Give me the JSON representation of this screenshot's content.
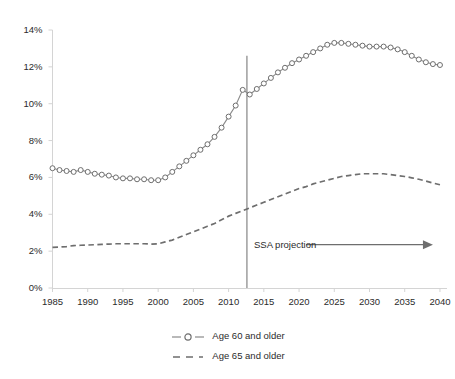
{
  "chart_data": {
    "type": "line",
    "title": "",
    "subtitle": "",
    "xlabel": "",
    "ylabel": "",
    "xlim": [
      1985,
      2041
    ],
    "ylim": [
      0,
      14
    ],
    "grid": false,
    "legend_position": "bottom",
    "y_tick_labels": [
      "0%",
      "2%",
      "4%",
      "6%",
      "8%",
      "10%",
      "12%",
      "14%"
    ],
    "y_ticks": [
      0,
      2,
      4,
      6,
      8,
      10,
      12,
      14
    ],
    "x_tick_labels": [
      "1985",
      "1990",
      "1995",
      "2000",
      "2005",
      "2010",
      "2015",
      "2020",
      "2025",
      "2030",
      "2035",
      "2040"
    ],
    "x_ticks": [
      1985,
      1990,
      1995,
      2000,
      2005,
      2010,
      2015,
      2020,
      2025,
      2030,
      2035,
      2040
    ],
    "x": [
      1985,
      1986,
      1987,
      1988,
      1989,
      1990,
      1991,
      1992,
      1993,
      1994,
      1995,
      1996,
      1997,
      1998,
      1999,
      2000,
      2001,
      2002,
      2003,
      2004,
      2005,
      2006,
      2007,
      2008,
      2009,
      2010,
      2011,
      2012,
      2013,
      2014,
      2015,
      2016,
      2017,
      2018,
      2019,
      2020,
      2021,
      2022,
      2023,
      2024,
      2025,
      2026,
      2027,
      2028,
      2029,
      2030,
      2031,
      2032,
      2033,
      2034,
      2035,
      2036,
      2037,
      2038,
      2039,
      2040
    ],
    "series": [
      {
        "name": "Age 60 and older",
        "style": "line-with-open-circle-markers",
        "color": "#7a7a7a",
        "values": [
          6.5,
          6.4,
          6.35,
          6.3,
          6.4,
          6.3,
          6.2,
          6.15,
          6.1,
          6.0,
          5.95,
          5.95,
          5.9,
          5.9,
          5.85,
          5.85,
          6.0,
          6.3,
          6.6,
          6.9,
          7.2,
          7.5,
          7.8,
          8.2,
          8.7,
          9.3,
          9.9,
          10.75,
          10.5,
          10.8,
          11.1,
          11.4,
          11.7,
          11.95,
          12.2,
          12.4,
          12.6,
          12.8,
          13.0,
          13.2,
          13.3,
          13.3,
          13.25,
          13.2,
          13.15,
          13.1,
          13.1,
          13.1,
          13.05,
          12.95,
          12.8,
          12.6,
          12.4,
          12.25,
          12.15,
          12.1
        ]
      },
      {
        "name": "Age 65 and older",
        "style": "dashed-line",
        "color": "#6e6e6e",
        "values": [
          2.2,
          2.22,
          2.25,
          2.3,
          2.32,
          2.33,
          2.35,
          2.37,
          2.38,
          2.4,
          2.4,
          2.4,
          2.4,
          2.4,
          2.38,
          2.4,
          2.5,
          2.6,
          2.75,
          2.9,
          3.05,
          3.2,
          3.35,
          3.5,
          3.7,
          3.9,
          4.05,
          4.2,
          4.35,
          4.5,
          4.65,
          4.8,
          4.95,
          5.1,
          5.25,
          5.4,
          5.5,
          5.65,
          5.75,
          5.85,
          5.95,
          6.05,
          6.1,
          6.15,
          6.2,
          6.2,
          6.2,
          6.2,
          6.15,
          6.1,
          6.05,
          5.98,
          5.9,
          5.8,
          5.7,
          5.6
        ]
      }
    ],
    "annotations": [
      {
        "name": "ssa-projection",
        "text": "SSA projection",
        "type": "text-with-arrow",
        "arrow_direction": "right",
        "arrow_from_year": 2021,
        "arrow_to_year": 2039,
        "at_value": 2.35
      },
      {
        "name": "projection-divider",
        "type": "vertical-line",
        "at_year": 2012.6,
        "color": "#7a7a7a"
      }
    ],
    "colors": {
      "axis": "#d4d4d4",
      "series_60": "#7a7a7a",
      "series_65": "#6e6e6e",
      "text": "#2b2b2b",
      "background": "#ffffff",
      "divider": "#7a7a7a",
      "arrow": "#6e6e6e"
    }
  },
  "legend": {
    "items": [
      {
        "label": "Age 60 and older",
        "marker": "open-circle-with-line"
      },
      {
        "label": "Age 65 and older",
        "marker": "dashed-line"
      }
    ]
  }
}
